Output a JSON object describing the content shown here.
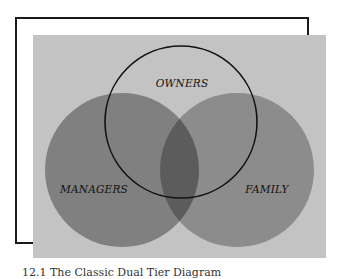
{
  "diagram": {
    "type": "venn",
    "sets": [
      {
        "id": "owners",
        "label": "OWNERS",
        "style": "outline",
        "color": "#111111"
      },
      {
        "id": "managers",
        "label": "MANAGERS",
        "style": "filled",
        "color": "#808080"
      },
      {
        "id": "family",
        "label": "FAMILY",
        "style": "filled",
        "color": "#8c8c8c"
      }
    ],
    "overlap_color": "#5c5c5c",
    "panel_color": "#c3c3c3"
  },
  "caption": "12.1  The Classic Dual Tier Diagram"
}
